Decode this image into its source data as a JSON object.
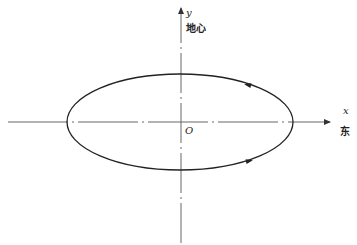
{
  "diagram": {
    "type": "orbit-ellipse",
    "axes": {
      "x": {
        "label": "x",
        "direction_label": "东"
      },
      "y": {
        "label": "y",
        "direction_label": "地心"
      },
      "origin_label": "O"
    },
    "orbit": {
      "shape": "ellipse",
      "center": "origin",
      "motion": "counterclockwise",
      "arrows": [
        "top-right pointing left",
        "bottom-right pointing right"
      ]
    },
    "colors": {
      "curve": "#222222",
      "axis": "#555555",
      "background": "#ffffff"
    }
  }
}
